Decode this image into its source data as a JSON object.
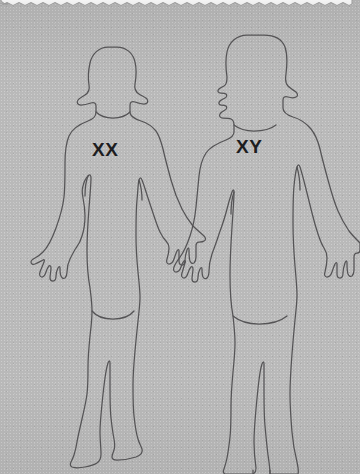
{
  "image": {
    "title": "Human karyotype sex chromosome diagram",
    "background_color": "#b9b9b9",
    "line_color": "#555456",
    "label_color": "#1d1d1f",
    "banner_color": "#ffffff"
  },
  "banner": {
    "name": "torn-paper-banner",
    "edge_style": "scalloped"
  },
  "figures": [
    {
      "id": "female",
      "label": "XX",
      "description": "female human outline figure",
      "side": "left"
    },
    {
      "id": "male",
      "label": "XY",
      "description": "male human outline figure",
      "side": "right"
    }
  ]
}
